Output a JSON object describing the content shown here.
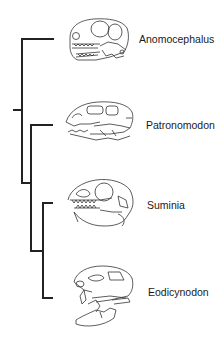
{
  "figure": {
    "type": "cladogram",
    "line_color": "#222222",
    "taxa": [
      {
        "name": "Anomocephalus",
        "skull_icon": "anomocephalus-skull-icon"
      },
      {
        "name": "Patronomodon",
        "skull_icon": "patronomodon-skull-icon"
      },
      {
        "name": "Suminia",
        "skull_icon": "suminia-skull-icon"
      },
      {
        "name": "Eodicynodon",
        "skull_icon": "eodicynodon-skull-icon"
      }
    ],
    "topology": "(Anomocephalus, (Patronomodon, (Suminia, Eodicynodon)))"
  }
}
